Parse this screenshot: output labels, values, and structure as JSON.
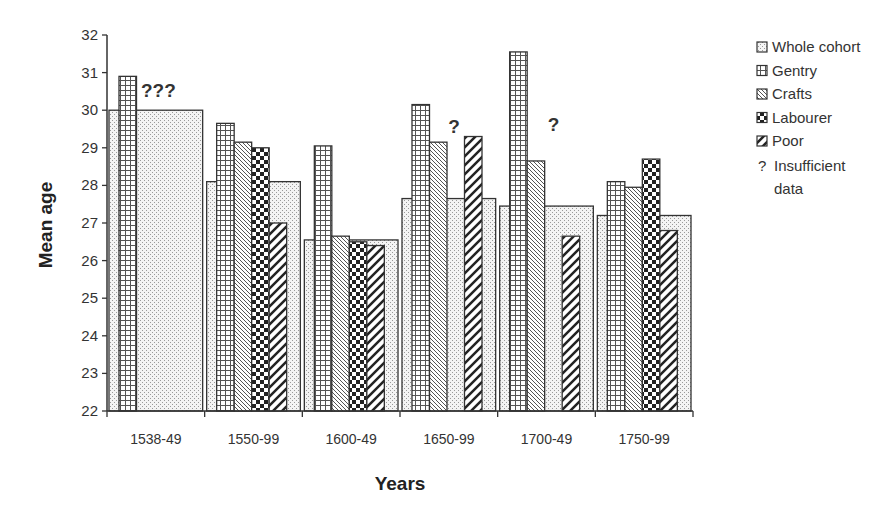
{
  "chart_data": {
    "type": "bar",
    "title": "",
    "xlabel": "Years",
    "ylabel": "Mean  age",
    "ylim": [
      22,
      32
    ],
    "yticks": [
      22,
      23,
      24,
      25,
      26,
      27,
      28,
      29,
      30,
      31,
      32
    ],
    "grid": false,
    "legend_position": "right",
    "categories": [
      "1538-49",
      "1550-99",
      "1600-49",
      "1650-99",
      "1700-49",
      "1750-99"
    ],
    "series": [
      {
        "name": "Whole cohort",
        "pattern": "dots",
        "values": [
          30.0,
          28.1,
          26.55,
          27.65,
          27.45,
          27.2
        ]
      },
      {
        "name": "Gentry",
        "pattern": "grid",
        "values": [
          30.9,
          29.65,
          29.05,
          30.15,
          31.55,
          28.1
        ]
      },
      {
        "name": "Crafts",
        "pattern": "diag-fine",
        "values": [
          null,
          29.15,
          26.65,
          29.15,
          28.65,
          27.95
        ]
      },
      {
        "name": "Labourer",
        "pattern": "checker",
        "values": [
          null,
          29.0,
          26.5,
          null,
          null,
          28.7
        ]
      },
      {
        "name": "Poor",
        "pattern": "diag-wide",
        "values": [
          null,
          27.0,
          26.4,
          29.3,
          26.65,
          26.8
        ]
      }
    ],
    "annotations": [
      {
        "category": "1538-49",
        "text": "???",
        "meaning": "Insufficient data"
      },
      {
        "category": "1650-99",
        "text": "?",
        "meaning": "Insufficient data"
      },
      {
        "category": "1700-49",
        "text": "?",
        "meaning": "Insufficient data"
      }
    ],
    "legend": [
      {
        "label": "Whole  cohort",
        "pattern": "dots"
      },
      {
        "label": "Gentry",
        "pattern": "grid"
      },
      {
        "label": "Crafts",
        "pattern": "diag-fine"
      },
      {
        "label": "Labourer",
        "pattern": "checker"
      },
      {
        "label": "Poor",
        "pattern": "diag-wide"
      },
      {
        "label": "Insufficient",
        "label2": "data",
        "symbol": "?"
      }
    ]
  }
}
